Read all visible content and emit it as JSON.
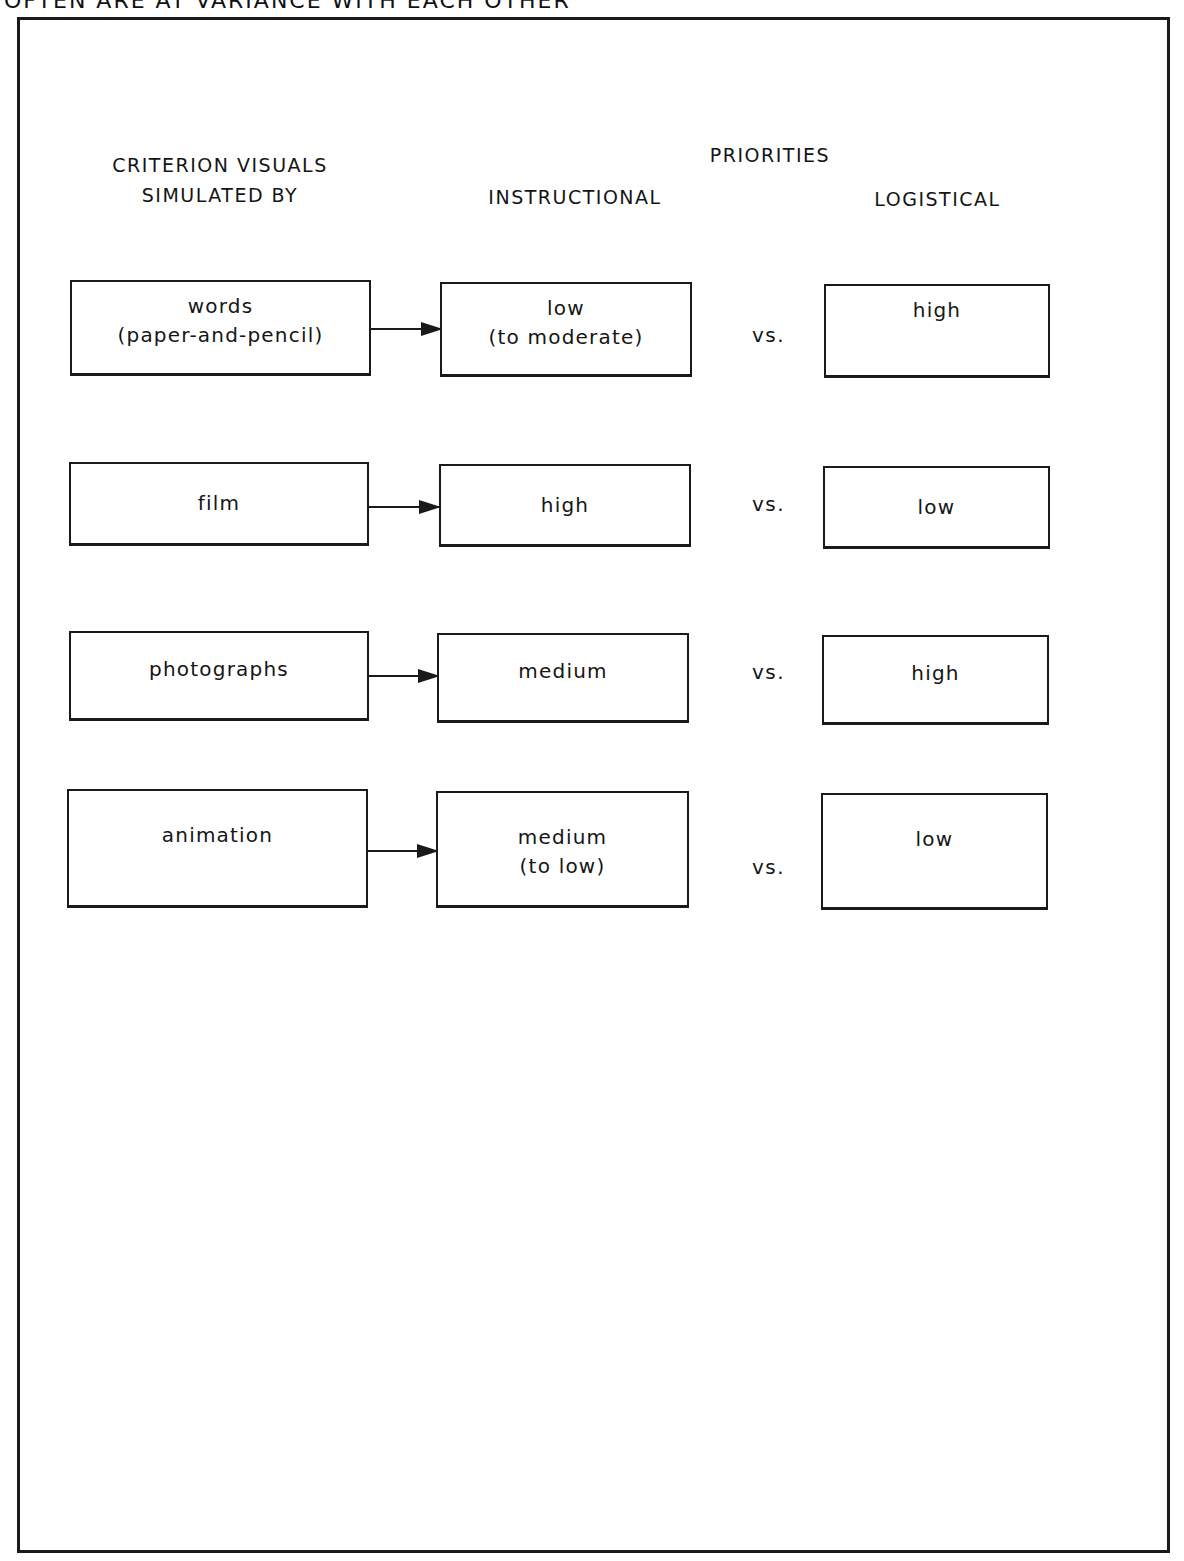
{
  "caption": "OFTEN ARE AT VARIANCE WITH EACH OTHER",
  "headers": {
    "criterion_line1": "CRITERION VISUALS",
    "criterion_line2": "SIMULATED BY",
    "priorities": "PRIORITIES",
    "instructional": "INSTRUCTIONAL",
    "logistical": "LOGISTICAL"
  },
  "separator": "vs.",
  "rows": [
    {
      "medium": [
        "words",
        "(paper-and-pencil)"
      ],
      "instructional": [
        "low",
        "(to moderate)"
      ],
      "logistical": [
        "high"
      ]
    },
    {
      "medium": [
        "film"
      ],
      "instructional": [
        "high"
      ],
      "logistical": [
        "low"
      ]
    },
    {
      "medium": [
        "photographs"
      ],
      "instructional": [
        "medium"
      ],
      "logistical": [
        "high"
      ]
    },
    {
      "medium": [
        "animation"
      ],
      "instructional": [
        "medium",
        "(to low)"
      ],
      "logistical": [
        "low"
      ]
    }
  ]
}
